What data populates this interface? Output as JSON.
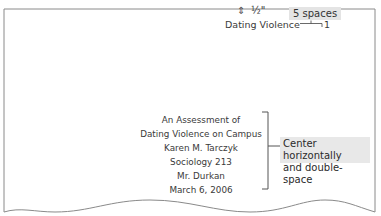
{
  "margin_note": {
    "icon": "up-down-arrow-icon",
    "icon_glyph": "⇕",
    "measurement": "½\""
  },
  "spacing_note": {
    "label": "5 spaces"
  },
  "running_head": {
    "text": "Dating Violence",
    "page_number": "1"
  },
  "title_page": {
    "lines": [
      "An Assessment of",
      "Dating Violence on Campus",
      "Karen M. Tarczyk",
      "Sociology 213",
      "Mr. Durkan",
      "March 6, 2006"
    ]
  },
  "callout": {
    "lines": [
      "Center horizontally",
      "and double-space"
    ]
  },
  "colors": {
    "page_border": "#8a8a8a",
    "label_background": "#e4e4e4",
    "text": "#333333"
  }
}
